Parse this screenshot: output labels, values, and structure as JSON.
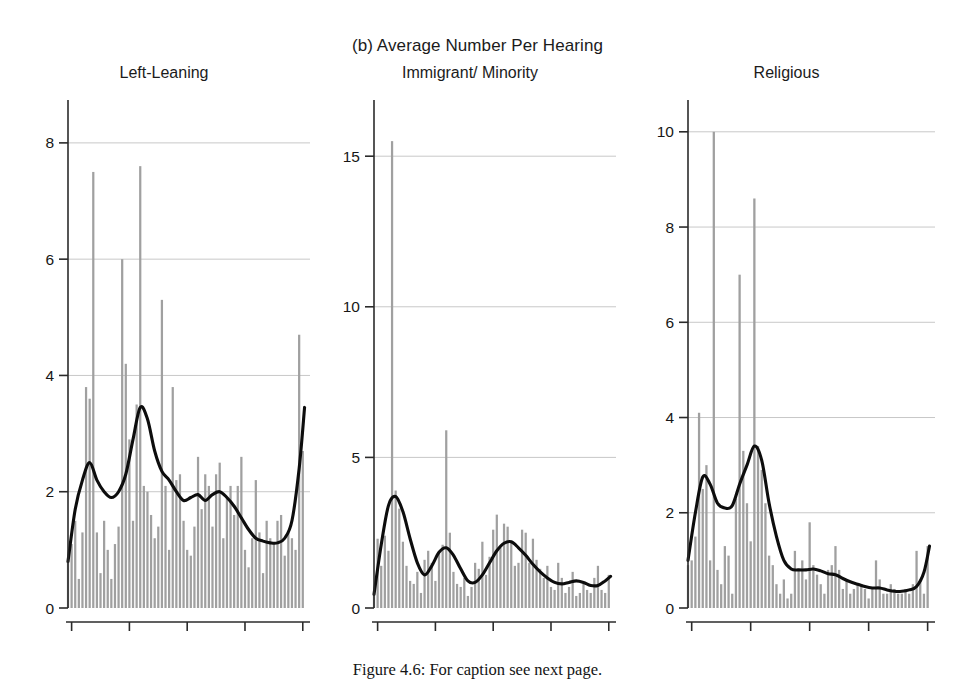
{
  "figure": {
    "title": "(b) Average Number Per Hearing",
    "caption": "Figure 4.6:  For caption see next page.",
    "bar_color": "#a0a0a0",
    "line_color": "#0d0d0d",
    "grid_color": "#c8c8c8",
    "axis_color": "#2b2b2b"
  },
  "panels": [
    {
      "title": "Left-Leaning",
      "ylabels": [
        "0",
        "2",
        "4",
        "6",
        "8"
      ],
      "xlabels": [
        "1946",
        "1962",
        "1978",
        "1994",
        "2010"
      ]
    },
    {
      "title": "Immigrant/ Minority",
      "ylabels": [
        "0",
        "5",
        "10",
        "15"
      ],
      "xlabels": [
        "1946",
        "1962",
        "1978",
        "1994",
        "2010"
      ]
    },
    {
      "title": "Religious",
      "ylabels": [
        "0",
        "2",
        "4",
        "6",
        "8",
        "10"
      ],
      "xlabels": [
        "1946",
        "1962",
        "1978",
        "1994",
        "2010"
      ]
    }
  ],
  "chart_data": {
    "type": "bar",
    "title": "(b) Average Number Per Hearing",
    "xlabel": "",
    "ylabel": "",
    "grid": true,
    "legend": "none",
    "xlim": [
      1945,
      2012
    ],
    "panels": [
      {
        "name": "Left-Leaning",
        "type": "bar",
        "ylim": [
          0,
          8.6
        ],
        "yticks": [
          0,
          2,
          4,
          6,
          8
        ],
        "xticks": [
          1946,
          1962,
          1978,
          1994,
          2010
        ],
        "x": [
          1945,
          1946,
          1947,
          1948,
          1949,
          1950,
          1951,
          1952,
          1953,
          1954,
          1955,
          1956,
          1957,
          1958,
          1959,
          1960,
          1961,
          1962,
          1963,
          1964,
          1965,
          1966,
          1967,
          1968,
          1969,
          1970,
          1971,
          1972,
          1973,
          1974,
          1975,
          1976,
          1977,
          1978,
          1979,
          1980,
          1981,
          1982,
          1983,
          1984,
          1985,
          1986,
          1987,
          1988,
          1989,
          1990,
          1991,
          1992,
          1993,
          1994,
          1995,
          1996,
          1997,
          1998,
          1999,
          2000,
          2001,
          2002,
          2003,
          2004,
          2005,
          2006,
          2007,
          2008,
          2009,
          2010,
          2011
        ],
        "bars": [
          0.8,
          1.1,
          1.5,
          0.5,
          1.3,
          3.8,
          3.6,
          7.5,
          1.3,
          0.6,
          1.5,
          1.0,
          0.5,
          1.1,
          1.4,
          6.0,
          4.2,
          2.9,
          1.5,
          3.5,
          7.6,
          2.1,
          2.0,
          1.6,
          1.2,
          1.4,
          5.3,
          2.1,
          1.0,
          3.8,
          2.2,
          2.3,
          1.5,
          1.0,
          0.9,
          1.4,
          2.6,
          1.7,
          2.3,
          2.1,
          1.4,
          2.3,
          2.5,
          1.2,
          1.9,
          2.1,
          1.6,
          2.1,
          2.6,
          1.0,
          0.7,
          1.2,
          2.2,
          1.3,
          0.6,
          1.5,
          1.2,
          1.1,
          1.5,
          1.6,
          0.9,
          1.3,
          1.2,
          1.0,
          4.7,
          2.7,
          0.0
        ],
        "smooth_line": {
          "name": "local polynomial smooth",
          "x": [
            1945,
            1947,
            1949,
            1951,
            1953,
            1955,
            1957,
            1959,
            1961,
            1963,
            1965,
            1967,
            1969,
            1971,
            1973,
            1975,
            1977,
            1979,
            1981,
            1983,
            1985,
            1987,
            1989,
            1991,
            1993,
            1995,
            1997,
            1999,
            2001,
            2003,
            2005,
            2007,
            2009,
            2010.5
          ],
          "y": [
            0.8,
            1.7,
            2.2,
            2.5,
            2.2,
            2.0,
            1.9,
            2.0,
            2.3,
            2.9,
            3.45,
            3.25,
            2.7,
            2.35,
            2.2,
            2.0,
            1.85,
            1.9,
            1.95,
            1.85,
            1.95,
            2.0,
            1.9,
            1.75,
            1.55,
            1.35,
            1.2,
            1.15,
            1.12,
            1.12,
            1.2,
            1.5,
            2.4,
            3.45
          ]
        }
      },
      {
        "name": "Immigrant/ Minority",
        "type": "bar",
        "ylim": [
          0,
          16.6
        ],
        "yticks": [
          0,
          5,
          10,
          15
        ],
        "xticks": [
          1946,
          1962,
          1978,
          1994,
          2010
        ],
        "x": [
          1945,
          1946,
          1947,
          1948,
          1949,
          1950,
          1951,
          1952,
          1953,
          1954,
          1955,
          1956,
          1957,
          1958,
          1959,
          1960,
          1961,
          1962,
          1963,
          1964,
          1965,
          1966,
          1967,
          1968,
          1969,
          1970,
          1971,
          1972,
          1973,
          1974,
          1975,
          1976,
          1977,
          1978,
          1979,
          1980,
          1981,
          1982,
          1983,
          1984,
          1985,
          1986,
          1987,
          1988,
          1989,
          1990,
          1991,
          1992,
          1993,
          1994,
          1995,
          1996,
          1997,
          1998,
          1999,
          2000,
          2001,
          2002,
          2003,
          2004,
          2005,
          2006,
          2007,
          2008,
          2009,
          2010,
          2011
        ],
        "bars": [
          0.4,
          2.3,
          1.4,
          2.4,
          1.9,
          15.5,
          3.9,
          3.3,
          2.2,
          1.4,
          0.9,
          0.8,
          1.2,
          0.5,
          1.6,
          1.9,
          1.5,
          0.9,
          1.8,
          2.1,
          5.9,
          2.5,
          1.2,
          0.8,
          0.7,
          1.0,
          0.4,
          0.7,
          1.5,
          1.3,
          2.2,
          1.1,
          1.7,
          2.6,
          3.1,
          2.0,
          2.8,
          2.7,
          2.2,
          1.4,
          1.5,
          2.6,
          2.5,
          1.5,
          2.3,
          1.6,
          1.3,
          1.0,
          1.4,
          0.7,
          0.6,
          1.5,
          1.0,
          0.5,
          0.7,
          1.2,
          0.4,
          0.5,
          0.8,
          0.6,
          0.5,
          1.0,
          1.4,
          0.6,
          0.5,
          1.1,
          0.0
        ],
        "smooth_line": {
          "name": "local polynomial smooth",
          "x": [
            1945,
            1947,
            1949,
            1951,
            1953,
            1955,
            1957,
            1959,
            1961,
            1963,
            1965,
            1967,
            1969,
            1971,
            1973,
            1975,
            1977,
            1979,
            1981,
            1983,
            1985,
            1987,
            1989,
            1991,
            1993,
            1995,
            1997,
            1999,
            2001,
            2003,
            2005,
            2007,
            2009,
            2010.5
          ],
          "y": [
            0.45,
            2.1,
            3.4,
            3.7,
            3.2,
            2.3,
            1.5,
            1.1,
            1.4,
            1.85,
            2.0,
            1.75,
            1.3,
            0.9,
            0.85,
            1.1,
            1.5,
            1.9,
            2.15,
            2.2,
            2.0,
            1.75,
            1.45,
            1.2,
            1.0,
            0.85,
            0.8,
            0.85,
            0.9,
            0.85,
            0.75,
            0.75,
            0.9,
            1.05
          ]
        }
      },
      {
        "name": "Religious",
        "type": "bar",
        "ylim": [
          0,
          10.5
        ],
        "yticks": [
          0,
          2,
          4,
          6,
          8,
          10
        ],
        "xticks": [
          1946,
          1962,
          1978,
          1994,
          2010
        ],
        "x": [
          1945,
          1946,
          1947,
          1948,
          1949,
          1950,
          1951,
          1952,
          1953,
          1954,
          1955,
          1956,
          1957,
          1958,
          1959,
          1960,
          1961,
          1962,
          1963,
          1964,
          1965,
          1966,
          1967,
          1968,
          1969,
          1970,
          1971,
          1972,
          1973,
          1974,
          1975,
          1976,
          1977,
          1978,
          1979,
          1980,
          1981,
          1982,
          1983,
          1984,
          1985,
          1986,
          1987,
          1988,
          1989,
          1990,
          1991,
          1992,
          1993,
          1994,
          1995,
          1996,
          1997,
          1998,
          1999,
          2000,
          2001,
          2002,
          2003,
          2004,
          2005,
          2006,
          2007,
          2008,
          2009,
          2010,
          2011
        ],
        "bars": [
          0.9,
          1.0,
          1.5,
          4.1,
          2.5,
          3.0,
          1.0,
          10.0,
          0.8,
          0.5,
          1.3,
          1.1,
          0.3,
          2.3,
          7.0,
          3.3,
          2.2,
          1.4,
          8.6,
          3.4,
          2.9,
          2.2,
          1.1,
          0.9,
          0.5,
          0.3,
          0.6,
          0.2,
          0.3,
          1.2,
          0.8,
          1.0,
          0.6,
          1.8,
          0.9,
          0.7,
          0.5,
          0.3,
          0.8,
          0.9,
          1.3,
          0.8,
          0.4,
          0.6,
          0.3,
          0.4,
          0.5,
          0.5,
          0.4,
          0.2,
          0.4,
          1.0,
          0.6,
          0.3,
          0.3,
          0.5,
          0.4,
          0.3,
          0.3,
          0.4,
          0.3,
          0.5,
          1.2,
          0.6,
          0.3,
          1.3,
          0.0
        ],
        "smooth_line": {
          "name": "local polynomial smooth",
          "x": [
            1945,
            1947,
            1949,
            1951,
            1953,
            1955,
            1957,
            1959,
            1961,
            1963,
            1965,
            1967,
            1969,
            1971,
            1973,
            1975,
            1977,
            1979,
            1981,
            1983,
            1985,
            1987,
            1989,
            1991,
            1993,
            1995,
            1997,
            1999,
            2001,
            2003,
            2005,
            2007,
            2009,
            2010.5
          ],
          "y": [
            1.0,
            2.0,
            2.75,
            2.6,
            2.2,
            2.1,
            2.15,
            2.6,
            3.0,
            3.4,
            3.1,
            2.2,
            1.5,
            1.0,
            0.82,
            0.8,
            0.8,
            0.82,
            0.78,
            0.72,
            0.7,
            0.62,
            0.55,
            0.5,
            0.45,
            0.42,
            0.42,
            0.38,
            0.35,
            0.35,
            0.38,
            0.45,
            0.75,
            1.3
          ]
        }
      }
    ]
  }
}
